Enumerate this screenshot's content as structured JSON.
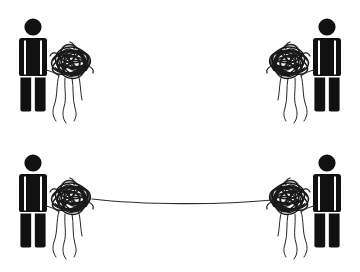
{
  "canvas": {
    "width": 360,
    "height": 272,
    "background": "#ffffff",
    "ink": "#111111",
    "thread_color": "#262626",
    "title": "Two rows of figures holding tangled string; bottom pair connected by a line"
  },
  "rows": [
    {
      "id": "row-top",
      "label": "Top row - unconnected tangles",
      "connected": false,
      "connector": null,
      "figures": [
        {
          "id": "top-left",
          "label": "Person holding tangle",
          "side": "left",
          "facing": "right",
          "person": {
            "x": 33,
            "y": 17,
            "head_cx": 33,
            "head_cy": 27,
            "head_r": 8.5,
            "height": 95
          },
          "tangle": {
            "cx": 71,
            "cy": 62,
            "rx": 20,
            "ry": 15,
            "threads": 4
          }
        },
        {
          "id": "top-right",
          "label": "Person holding tangle",
          "side": "right",
          "facing": "left",
          "person": {
            "x": 327,
            "y": 17,
            "head_cx": 327,
            "head_cy": 27,
            "head_r": 8.5,
            "height": 95
          },
          "tangle": {
            "cx": 289,
            "cy": 62,
            "rx": 20,
            "ry": 15,
            "threads": 4
          }
        }
      ]
    },
    {
      "id": "row-bottom",
      "label": "Bottom row - tangles joined by a single line",
      "connected": true,
      "connector": {
        "id": "connecting-line",
        "label": "Connecting thread between the two tangles",
        "from_x": 96,
        "to_x": 268,
        "from_y": 199,
        "to_y": 200,
        "sag_y": 205,
        "color": "#2b2b2b"
      },
      "figures": [
        {
          "id": "bottom-left",
          "label": "Person holding tangle",
          "side": "left",
          "facing": "right",
          "person": {
            "x": 33,
            "y": 153,
            "head_cx": 33,
            "head_cy": 163,
            "head_r": 8.5,
            "height": 95
          },
          "tangle": {
            "cx": 71,
            "cy": 198,
            "rx": 20,
            "ry": 15,
            "threads": 4
          }
        },
        {
          "id": "bottom-right",
          "label": "Person holding tangle",
          "side": "right",
          "facing": "left",
          "person": {
            "x": 327,
            "y": 153,
            "head_cx": 327,
            "head_cy": 163,
            "head_r": 8.5,
            "height": 95
          },
          "tangle": {
            "cx": 289,
            "cy": 198,
            "rx": 20,
            "ry": 15,
            "threads": 4
          }
        }
      ]
    }
  ],
  "icons": {
    "person": "person-pictogram-icon",
    "tangle": "tangled-string-icon",
    "threads": "dangling-threads-icon",
    "connector": "connecting-line-icon"
  }
}
